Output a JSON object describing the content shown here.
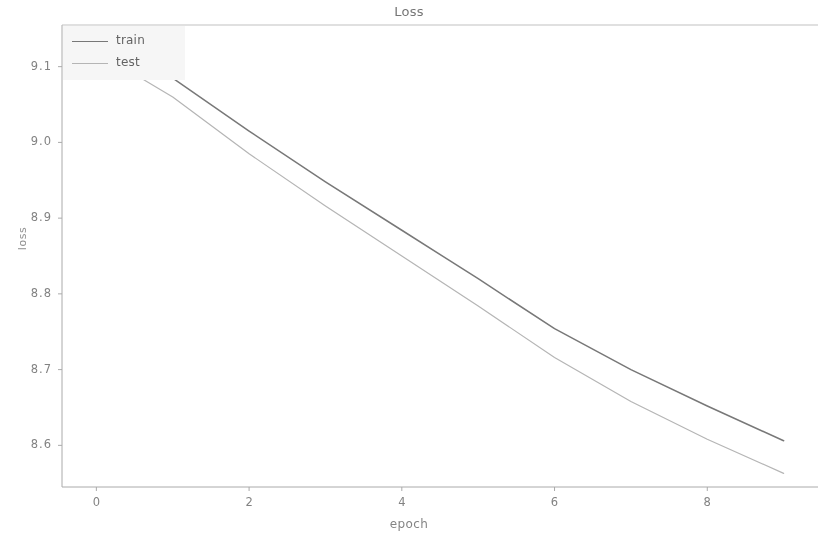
{
  "chart_data": {
    "type": "line",
    "title": "Loss",
    "xlabel": "epoch",
    "ylabel": "loss",
    "xlim": [
      -0.45,
      9.45
    ],
    "ylim": [
      8.545,
      9.155
    ],
    "grid": false,
    "legend_position": "upper left",
    "xticks": [
      0,
      2,
      4,
      6,
      8
    ],
    "xtick_labels": [
      "0",
      "2",
      "4",
      "6",
      "8"
    ],
    "yticks": [
      8.6,
      8.7,
      8.8,
      8.9,
      9.0,
      9.1
    ],
    "ytick_labels": [
      "8.6",
      "8.7",
      "8.8",
      "8.9",
      "9.0",
      "9.1"
    ],
    "x": [
      0,
      1,
      2,
      3,
      4,
      5,
      6,
      7,
      8,
      9
    ],
    "series": [
      {
        "name": "train",
        "color": "#6e6e6e",
        "values": [
          9.135,
          9.085,
          9.015,
          8.948,
          8.884,
          8.82,
          8.754,
          8.7,
          8.652,
          8.606
        ]
      },
      {
        "name": "test",
        "color": "#b4b4b4",
        "values": [
          9.12,
          9.06,
          8.985,
          8.916,
          8.85,
          8.784,
          8.716,
          8.658,
          8.608,
          8.563
        ]
      }
    ]
  },
  "legend": {
    "items": [
      {
        "label": "train"
      },
      {
        "label": "test"
      }
    ]
  },
  "colors": {
    "axis": "#9a9a9a",
    "text": "#7a7a7a",
    "background": "#ffffff"
  }
}
